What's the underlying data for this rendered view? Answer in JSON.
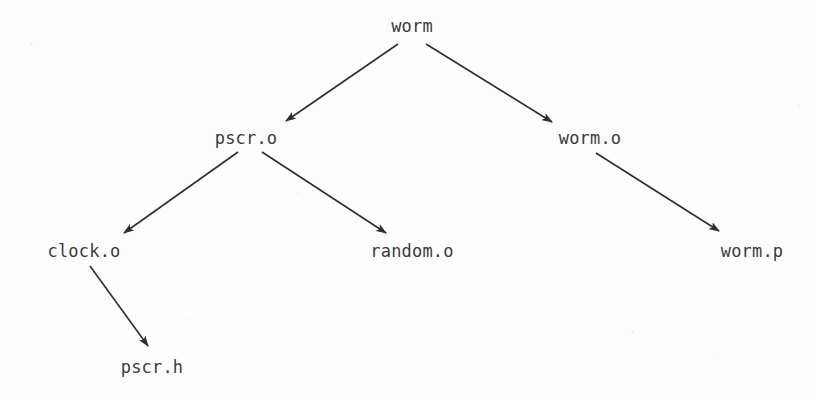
{
  "diagram": {
    "background_color": "#fdfdfd",
    "text_color": "#3b3b3b",
    "edge_color": "#2e2e2e",
    "nodes": [
      {
        "id": "worm",
        "label": "worm",
        "x": 412,
        "y": 26,
        "level": 0
      },
      {
        "id": "pscr_o",
        "label": "pscr.o",
        "x": 246,
        "y": 138,
        "level": 1
      },
      {
        "id": "worm_o",
        "label": "worm.o",
        "x": 590,
        "y": 138,
        "level": 1
      },
      {
        "id": "clock_o",
        "label": "clock.o",
        "x": 84,
        "y": 251,
        "level": 2
      },
      {
        "id": "random_o",
        "label": "random.o",
        "x": 412,
        "y": 251,
        "level": 2
      },
      {
        "id": "worm_p",
        "label": "worm.p",
        "x": 752,
        "y": 251,
        "level": 2
      },
      {
        "id": "pscr_h",
        "label": "pscr.h",
        "x": 152,
        "y": 367,
        "level": 3
      }
    ],
    "edges": [
      {
        "id": "worm-to-pscr_o",
        "from": "worm",
        "to": "pscr_o",
        "x1": 398,
        "y1": 44,
        "x2": 286,
        "y2": 121
      },
      {
        "id": "worm-to-worm_o",
        "from": "worm",
        "to": "worm_o",
        "x1": 426,
        "y1": 44,
        "x2": 552,
        "y2": 122
      },
      {
        "id": "pscr_o-to-clock_o",
        "from": "pscr_o",
        "to": "clock_o",
        "x1": 238,
        "y1": 152,
        "x2": 124,
        "y2": 233
      },
      {
        "id": "pscr_o-to-random_o",
        "from": "pscr_o",
        "to": "random_o",
        "x1": 262,
        "y1": 152,
        "x2": 386,
        "y2": 233
      },
      {
        "id": "clock_o-to-pscr_h",
        "from": "clock_o",
        "to": "pscr_h",
        "x1": 90,
        "y1": 266,
        "x2": 148,
        "y2": 346
      },
      {
        "id": "worm_o-to-worm_p",
        "from": "worm_o",
        "to": "worm_p",
        "x1": 596,
        "y1": 153,
        "x2": 719,
        "y2": 231
      }
    ],
    "specks": [
      {
        "x": 30,
        "y": 42,
        "size": 3
      },
      {
        "x": 797,
        "y": 104,
        "size": 3
      },
      {
        "x": 631,
        "y": 331,
        "size": 3
      },
      {
        "x": 297,
        "y": 192,
        "size": 2
      },
      {
        "x": 716,
        "y": 353,
        "size": 2
      },
      {
        "x": 188,
        "y": 318,
        "size": 2
      }
    ]
  }
}
